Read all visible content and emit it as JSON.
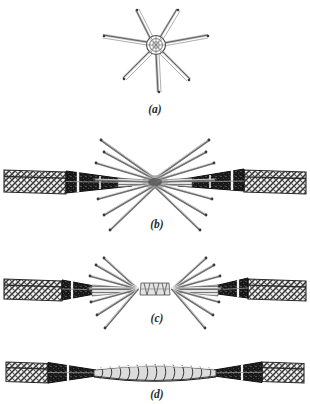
{
  "figure": {
    "background_color": "#ffffff",
    "ink_color": "#2b2b2b",
    "panel_count": 4,
    "panels": [
      {
        "id": "a",
        "caption": "(a)",
        "name": "end-view-of-opened-strands",
        "caption_x": 155,
        "caption_y": 113,
        "center_x": 155,
        "center_y": 45,
        "hub_radius": 8,
        "strand_count": 7,
        "strand_length": 48,
        "strand_angles_deg": [
          -90,
          -52,
          -14,
          24,
          62,
          140,
          205
        ],
        "strand_width": 2.0
      },
      {
        "id": "b",
        "caption": "(b)",
        "name": "strands-fanned-and-faced",
        "caption_x": 157,
        "caption_y": 228,
        "center_x": 155,
        "center_y": 182,
        "left_cable_x": 5,
        "right_cable_x": 305,
        "fan_count": 7,
        "fan_length": 78,
        "fan_spread_deg": 62,
        "gap": 0,
        "strand_width": 1.9
      },
      {
        "id": "c",
        "caption": "(c)",
        "name": "strands-meshed-at-joint",
        "caption_x": 157,
        "caption_y": 322,
        "center_x": 155,
        "center_y": 290,
        "left_cable_x": 5,
        "right_cable_x": 305,
        "fan_count": 7,
        "fan_length": 58,
        "fan_spread_deg": 58,
        "joint_width": 26,
        "joint_height": 10,
        "strand_width": 1.8
      },
      {
        "id": "d",
        "caption": "(d)",
        "name": "completed-wrapped-splice",
        "caption_x": 157,
        "caption_y": 396,
        "center_x": 155,
        "center_y": 374,
        "left_cable_x": 5,
        "right_cable_x": 305,
        "wrap_turns": 13,
        "wrap_length": 114,
        "wrap_max_height": 13
      }
    ],
    "cable": {
      "name": "braided-sheathed-cable",
      "sheath_label": "braided outer sheath",
      "sheath_length": 62,
      "sheath_height": 22,
      "taper_label": "dark tapered ferrule",
      "taper_length": 72,
      "band_label": "white binding band",
      "core_label": "exposed core strands",
      "core_length": 30,
      "sheath_fill": "#e9e9e9",
      "taper_fill": "#1d1d1d",
      "band_fill": "#f6f6f6",
      "core_fill": "#d8d8d8"
    },
    "captions": {
      "a": "(a)",
      "b": "(b)",
      "c": "(c)",
      "d": "(d)"
    }
  }
}
